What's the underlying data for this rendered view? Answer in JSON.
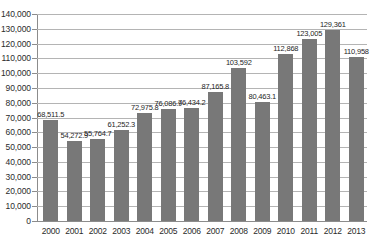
{
  "chart_data": {
    "type": "bar",
    "title": "",
    "xlabel": "(年)",
    "ylabel": "",
    "ylim": [
      0,
      140000
    ],
    "ytick_step": 10000,
    "grid": true,
    "legend": "none",
    "bar_color": "#787878",
    "categories": [
      "2000",
      "2001",
      "2002",
      "2003",
      "2004",
      "2005",
      "2006",
      "2007",
      "2008",
      "2009",
      "2010",
      "2011",
      "2012",
      "2013"
    ],
    "values": [
      68511.5,
      54272.9,
      55764.7,
      61252.3,
      72975.8,
      76086.9,
      76434.2,
      87165.8,
      103592,
      80463.1,
      112868,
      123005,
      129361,
      110958
    ],
    "value_labels": [
      "68,511.5",
      "54,272.9",
      "55,764.7",
      "61,252.3",
      "72,975.8",
      "76,086.9",
      "76,434.2",
      "87,165.8",
      "103,592",
      "80,463.1",
      "112,868",
      "123,005",
      "129,361",
      "110,958"
    ],
    "ytick_labels": [
      "140,000",
      "130,000",
      "120,000",
      "110,000",
      "100,000",
      "90,000",
      "80,000",
      "70,000",
      "60,000",
      "50,000",
      "40,000",
      "30,000",
      "20,000",
      "10,000",
      "0"
    ],
    "ytick_values": [
      140000,
      130000,
      120000,
      110000,
      100000,
      90000,
      80000,
      70000,
      60000,
      50000,
      40000,
      30000,
      20000,
      10000,
      0
    ]
  }
}
